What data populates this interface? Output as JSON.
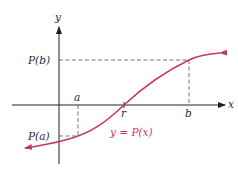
{
  "diagram": {
    "type": "function-graph",
    "axes": {
      "x_label": "x",
      "y_label": "y"
    },
    "points": {
      "a_label": "a",
      "b_label": "b",
      "r_label": "r",
      "pa_label": "P(a)",
      "pb_label": "P(b)"
    },
    "curve": {
      "label": "y = P(x)",
      "color": "#c8385a"
    },
    "colors": {
      "axis": "#1e1e28",
      "dashed": "#5a6478",
      "text": "#2a2a3a"
    }
  }
}
